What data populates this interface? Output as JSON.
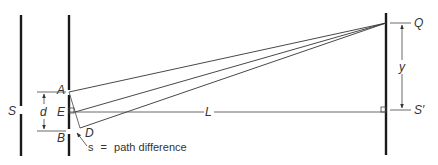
{
  "diagram": {
    "colors": {
      "line": "#1a1a1a",
      "text": "#333333",
      "background": "#ffffff"
    },
    "labels": {
      "source_slit": "S",
      "slit_top": "A",
      "slit_bottom": "B",
      "slit_mid": "E",
      "foot": "D",
      "separation": "d",
      "distance": "L",
      "screen_point": "Q",
      "screen_center": "S′",
      "height": "y"
    },
    "annotation": {
      "symbol": "s",
      "equals": "=",
      "text": "path difference"
    }
  }
}
